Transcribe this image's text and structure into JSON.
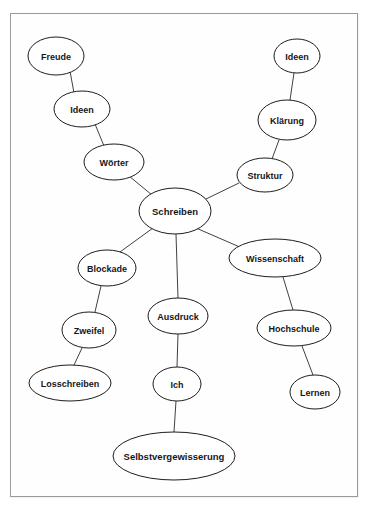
{
  "diagram": {
    "type": "mindmap",
    "title": "Schreiben",
    "background_color": "#ffffff",
    "frame_color": "#9a9a9a",
    "node_fill": "#ffffff",
    "node_stroke": "#1d1d1d",
    "edge_color": "#2b2b2b",
    "text_color": "#16161a",
    "nodes": [
      {
        "id": "freude",
        "label": "Freude",
        "cx": 56,
        "cy": 56,
        "rx": 28,
        "ry": 19,
        "font_size": 9
      },
      {
        "id": "ideen_left",
        "label": "Ideen",
        "cx": 82,
        "cy": 109,
        "rx": 28,
        "ry": 18,
        "font_size": 9
      },
      {
        "id": "woerter",
        "label": "Wörter",
        "cx": 114,
        "cy": 162,
        "rx": 30,
        "ry": 18,
        "font_size": 9
      },
      {
        "id": "schreiben",
        "label": "Schreiben",
        "cx": 175,
        "cy": 211,
        "rx": 36,
        "ry": 23,
        "font_size": 9.5
      },
      {
        "id": "ideen_right",
        "label": "Ideen",
        "cx": 297,
        "cy": 56,
        "rx": 23,
        "ry": 17,
        "font_size": 9
      },
      {
        "id": "klaerung",
        "label": "Klärung",
        "cx": 287,
        "cy": 120,
        "rx": 29,
        "ry": 20,
        "font_size": 9
      },
      {
        "id": "struktur",
        "label": "Struktur",
        "cx": 265,
        "cy": 175,
        "rx": 28,
        "ry": 17,
        "font_size": 9
      },
      {
        "id": "wissenschaft",
        "label": "Wissenschaft",
        "cx": 275,
        "cy": 258,
        "rx": 46,
        "ry": 19,
        "font_size": 9
      },
      {
        "id": "hochschule",
        "label": "Hochschule",
        "cx": 294,
        "cy": 328,
        "rx": 37,
        "ry": 18,
        "font_size": 9
      },
      {
        "id": "lernen",
        "label": "Lernen",
        "cx": 315,
        "cy": 392,
        "rx": 25,
        "ry": 17,
        "font_size": 9
      },
      {
        "id": "blockade",
        "label": "Blockade",
        "cx": 107,
        "cy": 268,
        "rx": 29,
        "ry": 18,
        "font_size": 9
      },
      {
        "id": "zweifel",
        "label": "Zweifel",
        "cx": 89,
        "cy": 330,
        "rx": 27,
        "ry": 18,
        "font_size": 9
      },
      {
        "id": "losschreiben",
        "label": "Losschreiben",
        "cx": 70,
        "cy": 383,
        "rx": 41,
        "ry": 18,
        "font_size": 9
      },
      {
        "id": "ausdruck",
        "label": "Ausdruck",
        "cx": 178,
        "cy": 316,
        "rx": 30,
        "ry": 18,
        "font_size": 9
      },
      {
        "id": "ich",
        "label": "Ich",
        "cx": 177,
        "cy": 384,
        "rx": 24,
        "ry": 17,
        "font_size": 9
      },
      {
        "id": "selbst",
        "label": "Selbstvergewisserung",
        "cx": 174,
        "cy": 456,
        "rx": 61,
        "ry": 24,
        "font_size": 9.5
      }
    ],
    "edges": [
      {
        "id": "e-freude-ideen",
        "from": "freude",
        "to": "ideen_left",
        "x1": 70,
        "y1": 71,
        "x2": 74,
        "y2": 93
      },
      {
        "id": "e-ideen-woerter",
        "from": "ideen_left",
        "to": "woerter",
        "x1": 95,
        "y1": 124,
        "x2": 104,
        "y2": 146
      },
      {
        "id": "e-woerter-schreiben",
        "from": "woerter",
        "to": "schreiben",
        "x1": 129,
        "y1": 176,
        "x2": 152,
        "y2": 195
      },
      {
        "id": "e-ideenright-klaerung",
        "from": "ideen_right",
        "to": "klaerung",
        "x1": 294,
        "y1": 73,
        "x2": 290,
        "y2": 100
      },
      {
        "id": "e-klaerung-struktur",
        "from": "klaerung",
        "to": "struktur",
        "x1": 279,
        "y1": 140,
        "x2": 272,
        "y2": 159
      },
      {
        "id": "e-struktur-schreiben",
        "from": "struktur",
        "to": "schreiben",
        "x1": 239,
        "y1": 183,
        "x2": 206,
        "y2": 199
      },
      {
        "id": "e-schreiben-wissenschaft",
        "from": "schreiben",
        "to": "wissenschaft",
        "x1": 196,
        "y1": 228,
        "x2": 242,
        "y2": 248
      },
      {
        "id": "e-wissenschaft-hochschule",
        "from": "wissenschaft",
        "to": "hochschule",
        "x1": 283,
        "y1": 277,
        "x2": 293,
        "y2": 310
      },
      {
        "id": "e-hochschule-lernen",
        "from": "hochschule",
        "to": "lernen",
        "x1": 302,
        "y1": 346,
        "x2": 313,
        "y2": 375
      },
      {
        "id": "e-schreiben-blockade",
        "from": "schreiben",
        "to": "blockade",
        "x1": 153,
        "y1": 228,
        "x2": 120,
        "y2": 252
      },
      {
        "id": "e-blockade-zweifel",
        "from": "blockade",
        "to": "zweifel",
        "x1": 101,
        "y1": 286,
        "x2": 95,
        "y2": 312
      },
      {
        "id": "e-zweifel-losschreiben",
        "from": "zweifel",
        "to": "losschreiben",
        "x1": 82,
        "y1": 348,
        "x2": 74,
        "y2": 365
      },
      {
        "id": "e-schreiben-ausdruck",
        "from": "schreiben",
        "to": "ausdruck",
        "x1": 176,
        "y1": 234,
        "x2": 178,
        "y2": 298
      },
      {
        "id": "e-ausdruck-ich",
        "from": "ausdruck",
        "to": "ich",
        "x1": 178,
        "y1": 334,
        "x2": 177,
        "y2": 367
      },
      {
        "id": "e-ich-selbst",
        "from": "ich",
        "to": "selbst",
        "x1": 176,
        "y1": 401,
        "x2": 174,
        "y2": 432
      }
    ]
  }
}
